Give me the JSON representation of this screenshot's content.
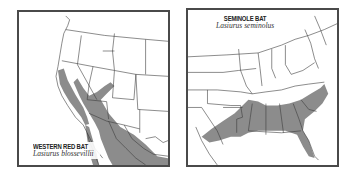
{
  "maps": [
    {
      "id": "western-red-bat",
      "common_name": "WESTERN RED BAT",
      "scientific_name": "Lasiurus blossevillii",
      "region_shown": "Western United States and Mexico",
      "range_color": "#8c8c8c"
    },
    {
      "id": "seminole-bat",
      "common_name": "SEMINOLE BAT",
      "scientific_name": "Lasiurus seminolus",
      "region_shown": "Eastern and Southeastern United States",
      "range_color": "#8c8c8c"
    }
  ],
  "colors": {
    "frame": "#4a4a4a",
    "border_lines": "#3a3a3a",
    "range_fill": "#8c8c8c",
    "background": "#ffffff"
  }
}
